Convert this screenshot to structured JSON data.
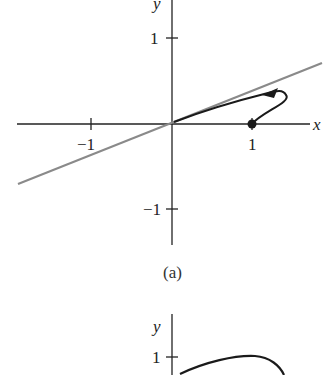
{
  "figure_a": {
    "caption": "(a)",
    "x_axis_label": "x",
    "y_axis_label": "y",
    "x_ticks": [
      "−1",
      "1"
    ],
    "y_ticks": [
      "1",
      "−1"
    ],
    "line_color": "#8a8a8a",
    "curve_color": "#1a1a1a",
    "marker": "filled-dot at (1, 0)",
    "description": "Gray line through origin with positive slope; black curve starting at dot (1,0) looping up-right then arrowing left toward origin along the line"
  },
  "figure_b": {
    "y_axis_label": "y",
    "y_ticks": [
      "1"
    ],
    "curve_color": "#1a1a1a",
    "description": "Black curve rising from near y-axis to a peak above y=1 then turning downward (partially visible)"
  }
}
